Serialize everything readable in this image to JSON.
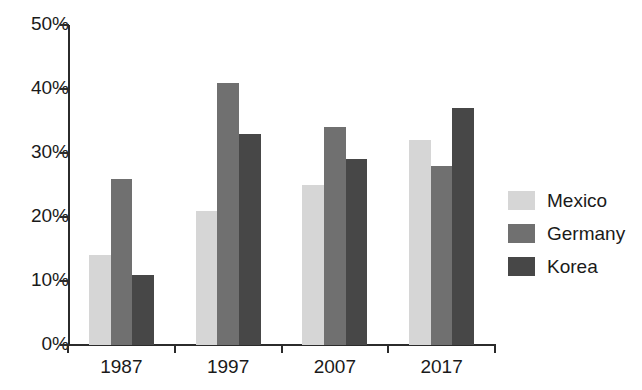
{
  "chart_data": {
    "type": "bar",
    "title": "",
    "subtitle": "",
    "xlabel": "",
    "ylabel": "",
    "categories": [
      "1987",
      "1997",
      "2007",
      "2017"
    ],
    "series": [
      {
        "name": "Mexico",
        "values": [
          14,
          21,
          25,
          32
        ],
        "color": "#d6d6d6"
      },
      {
        "name": "Germany",
        "values": [
          26,
          41,
          34,
          28
        ],
        "color": "#707070"
      },
      {
        "name": "Korea",
        "values": [
          11,
          33,
          29,
          37
        ],
        "color": "#474747"
      }
    ],
    "ylim": [
      0,
      50
    ],
    "ytick_values": [
      0,
      10,
      20,
      30,
      40,
      50
    ],
    "ytick_labels": [
      "0%",
      "10%",
      "20%",
      "30%",
      "40%",
      "50%"
    ],
    "grid": false,
    "legend_position": "right",
    "value_suffix": "%"
  },
  "legend": {
    "entries": [
      {
        "label": "Mexico",
        "color": "#d6d6d6"
      },
      {
        "label": "Germany",
        "color": "#707070"
      },
      {
        "label": "Korea",
        "color": "#474747"
      }
    ]
  },
  "axes": {
    "y_labels": [
      "50%",
      "40%",
      "30%",
      "20%",
      "10%",
      "0%"
    ],
    "x_labels": [
      "1987",
      "1997",
      "2007",
      "2017"
    ]
  }
}
